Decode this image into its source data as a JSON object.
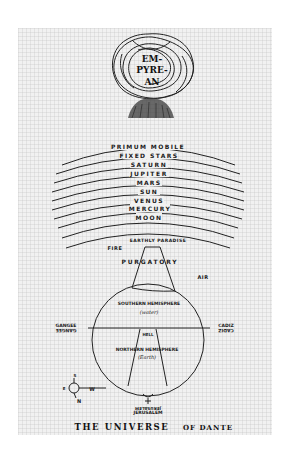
{
  "figure": {
    "title": "THE UNIVERSE",
    "title_suffix": "OF DANTE",
    "empyrean": [
      "EM-",
      "PYRE-",
      "AN"
    ],
    "heavens": [
      {
        "label": "PRIMUM MOBILE",
        "y": 148
      },
      {
        "label": "FIXED STARS",
        "y": 157
      },
      {
        "label": "SATURN",
        "y": 166
      },
      {
        "label": "JUPITER",
        "y": 175
      },
      {
        "label": "MARS",
        "y": 184
      },
      {
        "label": "SUN",
        "y": 193
      },
      {
        "label": "VENUS",
        "y": 202
      },
      {
        "label": "MERCURY",
        "y": 210
      },
      {
        "label": "MOON",
        "y": 219
      }
    ],
    "earthly_paradise": "EARTHLY PARADISE",
    "fire": "FIRE",
    "purgatory": "PURGATORY",
    "air": "AIR",
    "southern_hemisphere": "SOUTHERN HEMISPHERE",
    "southern_sub": "(water)",
    "northern_hemisphere": "NORTHERN HEMISPHERE",
    "northern_sub": "(Earth)",
    "hell": "HELL",
    "gangee": "GANGEE",
    "cadiz": "CADIZ",
    "jerusalem": "JERUSALEM",
    "compass": {
      "s": "S",
      "e": "E",
      "w": "W",
      "n": "N"
    },
    "colors": {
      "ink": "#1a1a1a",
      "paper": "#f1f1f1",
      "background": "#ffffff"
    }
  }
}
